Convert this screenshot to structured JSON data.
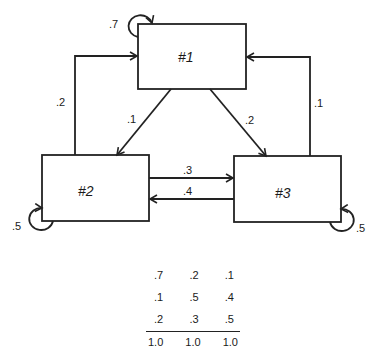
{
  "nodes": [
    {
      "id": "1",
      "label": "#1"
    },
    {
      "id": "2",
      "label": "#2"
    },
    {
      "id": "3",
      "label": "#3"
    }
  ],
  "edges": {
    "self_1": ".7",
    "n2_to_n1": ".2",
    "n3_to_n1": ".1",
    "n1_to_n2": ".1",
    "n1_to_n3": ".2",
    "n2_to_n3": ".3",
    "n3_to_n2": ".4",
    "self_2": ".5",
    "self_3": ".5"
  },
  "matrix": {
    "rows": [
      [
        ".7",
        ".2",
        ".1"
      ],
      [
        ".1",
        ".5",
        ".4"
      ],
      [
        ".2",
        ".3",
        ".5"
      ]
    ],
    "totals": [
      "1.0",
      "1.0",
      "1.0"
    ]
  },
  "colors": {
    "line": "#222222",
    "background": "#ffffff"
  }
}
